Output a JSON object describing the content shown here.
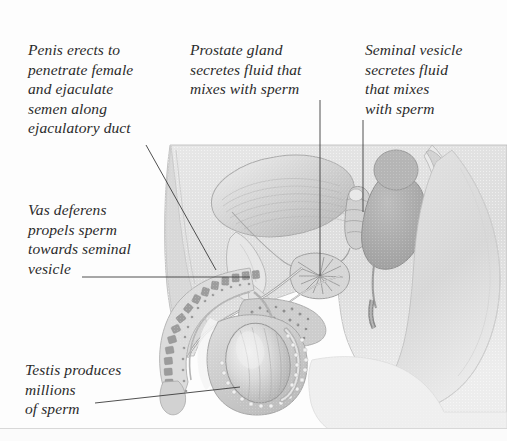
{
  "figure": {
    "style": "grayscale scanned anatomical illustration",
    "background_color": "#fdfdfd",
    "text_color": "#2b2b2b",
    "leader_line_color": "#3c3c3c"
  },
  "labels": {
    "penis": "Penis erects to\npenetrate female\nand ejaculate\nsemen along\nejaculatory duct",
    "prostate": "Prostate gland\nsecretes fluid that\nmixes with sperm",
    "seminal_vesicle": "Seminal vesicle\nsecretes fluid\nthat mixes\nwith sperm",
    "vas_deferens": "Vas deferens\npropels sperm\ntowards seminal\nvesicle",
    "testis": "Testis produces\nmillions\nof sperm"
  },
  "anatomy_parts": [
    "penis-shaft",
    "glans-penis",
    "urethra",
    "scrotum",
    "testis",
    "epididymis",
    "vas-deferens",
    "seminal-vesicle",
    "prostate-gland",
    "bladder",
    "pubic-bone",
    "rectum",
    "sacrum-coccyx",
    "gluteal-region",
    "abdominal-wall"
  ],
  "palette": {
    "skin_light": "#e2e2e2",
    "tissue_mid": "#c9c9c9",
    "tissue_dark": "#b0b0b0",
    "organ_shadow": "#9a9a9a",
    "highlight": "#f2f2f2",
    "outline": "#8a8a8a",
    "deep": "#8c8c8c"
  }
}
